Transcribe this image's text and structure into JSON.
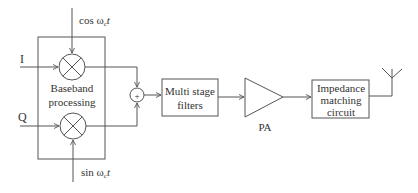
{
  "diagram": {
    "colors": {
      "line": "#555555",
      "text": "#333333",
      "background": "#ffffff"
    },
    "inputs": {
      "i_label": "I",
      "q_label": "Q"
    },
    "oscillators": {
      "cos": {
        "prefix": "cos ",
        "omega": "ω",
        "sub": "c",
        "t": "t"
      },
      "sin": {
        "prefix": "sin ",
        "omega": "ω",
        "sub": "c",
        "t": "t"
      }
    },
    "baseband_block": {
      "line1": "Baseband",
      "line2": "processing"
    },
    "summer": {
      "symbol": "+"
    },
    "filter_block": {
      "line1": "Multi stage",
      "line2": "filters"
    },
    "amplifier": {
      "label": "PA"
    },
    "matching_block": {
      "line1": "Impedance",
      "line2": "matching",
      "line3": "circuit"
    },
    "antenna": {
      "icon": "antenna-icon"
    }
  }
}
